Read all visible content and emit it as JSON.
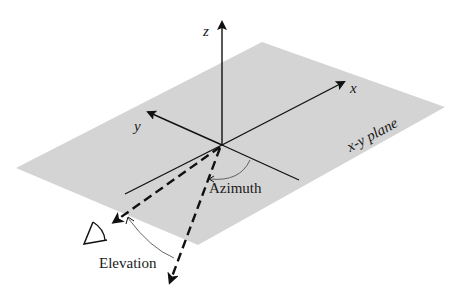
{
  "diagram": {
    "type": "3d-coordinate-diagram",
    "plane": {
      "label": "x-y plane",
      "color": "#d4d4d4"
    },
    "axes": {
      "x": {
        "label": "x"
      },
      "y": {
        "label": "y"
      },
      "z": {
        "label": "z"
      }
    },
    "angles": {
      "azimuth": {
        "label": "Azimuth"
      },
      "elevation": {
        "label": "Elevation"
      }
    },
    "observer": {
      "icon": "eye-icon"
    },
    "colors": {
      "line": "#111111",
      "arc": "#555555",
      "background": "#ffffff"
    }
  }
}
